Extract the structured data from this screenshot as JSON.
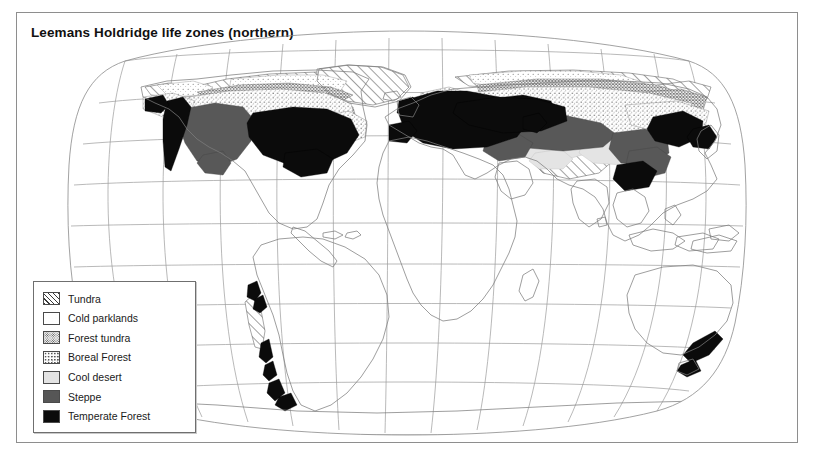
{
  "figure": {
    "title": "Leemans Holdridge life zones (northern)",
    "bottom_caption_partial": "",
    "frame_color": "#8e8e8e",
    "background": "#ffffff"
  },
  "legend": {
    "items": [
      {
        "label": "Tundra",
        "pattern": "diagonal-hatch",
        "color": "#3a3a3a"
      },
      {
        "label": "Cold parklands",
        "pattern": "sparse-dots",
        "color": "#6d6d6d"
      },
      {
        "label": "Forest tundra",
        "pattern": "dense-dots",
        "color": "#4a4a4a"
      },
      {
        "label": "Boreal Forest",
        "pattern": "medium-dots",
        "color": "#585858"
      },
      {
        "label": "Cool desert",
        "pattern": "solid",
        "color": "#e3e3e3"
      },
      {
        "label": "Steppe",
        "pattern": "solid",
        "color": "#565656"
      },
      {
        "label": "Temperate Forest",
        "pattern": "solid",
        "color": "#0b0b0b"
      }
    ],
    "border_color": "#6f6f6f"
  },
  "map": {
    "projection": "robinson-style",
    "graticule": {
      "meridian_count": 13,
      "parallel_count": 9,
      "line_color": "#9a9a9a"
    },
    "coastline_color": "#7a7a7a",
    "regions_depicted": [
      "North America",
      "Greenland",
      "Europe",
      "Asia",
      "Africa",
      "South America",
      "Australia",
      "New Zealand",
      "Antarctica"
    ]
  }
}
